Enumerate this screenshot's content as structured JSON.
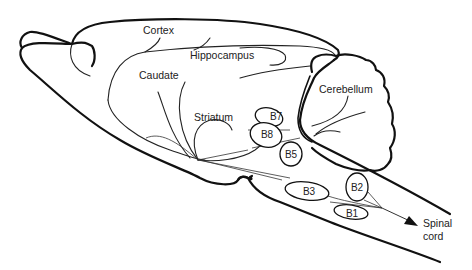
{
  "diagram": {
    "regions": {
      "cortex": "Cortex",
      "hippocampus": "Hippocampus",
      "caudate": "Caudate",
      "striatum": "Striatum",
      "cerebellum": "Cerebellum"
    },
    "nuclei": {
      "b1": "B1",
      "b2": "B2",
      "b3": "B3",
      "b5": "B5",
      "b7": "B7",
      "b8": "B8"
    },
    "spinal_cord": {
      "line1": "Spinal",
      "line2": "cord"
    },
    "colors": {
      "stroke": "#111111",
      "background": "#ffffff"
    }
  }
}
